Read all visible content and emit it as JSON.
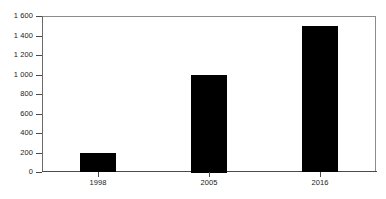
{
  "chart_data": {
    "type": "bar",
    "title": "",
    "subtitle": "",
    "xlabel": "",
    "ylabel": "",
    "categories": [
      "1998",
      "2005",
      "2016"
    ],
    "values": [
      190,
      1000,
      1500
    ],
    "series": [
      {
        "name": "",
        "values": [
          190,
          1000,
          1500
        ]
      }
    ],
    "ylim": [
      0,
      1600
    ],
    "y_ticks": [
      0,
      200,
      400,
      600,
      800,
      1000,
      1200,
      1400,
      1600
    ],
    "y_tick_labels": [
      "0",
      "200",
      "400",
      "600",
      "800",
      "1 000",
      "1 200",
      "1 400",
      "1 600"
    ],
    "x_tick_labels": [
      "1998",
      "2005",
      "2016"
    ],
    "grid": false,
    "legend": null,
    "legend_position": "none",
    "annotations": [],
    "bar_color": "#000000",
    "background_color": "#ffffff",
    "frame_color": "#8c8c8c",
    "axis_color": "#4a4a4a",
    "text_color": "#1a1a1a"
  }
}
